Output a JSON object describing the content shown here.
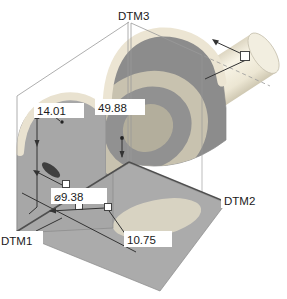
{
  "scene": {
    "kind": "cad-3d-part-view"
  },
  "datums": {
    "dtm1": "DTM1",
    "dtm2": "DTM2",
    "dtm3": "DTM3"
  },
  "dimensions": {
    "height": "14.01",
    "width": "49.88",
    "hole_diameter": "⌀9.38",
    "offset": "10.75"
  },
  "colors": {
    "background": "#ffffff",
    "body_medium": "#ababab",
    "body_plate": "#a7a7a7",
    "body_dark": "#8c8c8c",
    "highlight_cream": "#ece5d3",
    "shaft_cream": "#f4f0e2",
    "bore_light": "#d8d3c2",
    "ring_tan": "#c8c2af",
    "edge_dark": "#4f4f4f",
    "wireframe": "#999999",
    "dimension_line": "#333333",
    "text": "#1a1a1a"
  }
}
